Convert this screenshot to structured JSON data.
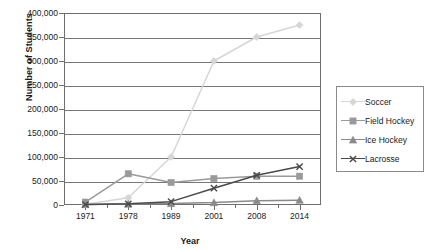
{
  "chart_data": {
    "type": "line",
    "title": "",
    "xlabel": "Year",
    "ylabel": "Number of Students",
    "x": [
      1971,
      1978,
      1989,
      2001,
      2008,
      2014
    ],
    "categories": [
      "1971",
      "1978",
      "1989",
      "2001",
      "2008",
      "2014"
    ],
    "xtick_labels": [
      "1971",
      "1978",
      "1989",
      "2001",
      "2008",
      "2014"
    ],
    "ytick_labels": [
      "0",
      "50,000",
      "100,000",
      "150,000",
      "200,000",
      "250,000",
      "300,000",
      "350,000",
      "400,000"
    ],
    "ytick_values": [
      0,
      50000,
      100000,
      150000,
      200000,
      250000,
      300000,
      350000,
      400000
    ],
    "ylim": [
      0,
      400000
    ],
    "grid": true,
    "legend_position": "right",
    "series": [
      {
        "name": "Soccer",
        "marker": "diamond",
        "color": "#d6d6d6",
        "values": [
          1500,
          15000,
          100000,
          300000,
          350000,
          375000
        ]
      },
      {
        "name": "Field Hockey",
        "marker": "square",
        "color": "#9a9a9a",
        "values": [
          6000,
          65000,
          47000,
          55000,
          60000,
          60000
        ]
      },
      {
        "name": "Ice Hockey",
        "marker": "triangle",
        "color": "#8a8a8a",
        "values": [
          1000,
          2000,
          3000,
          5000,
          9000,
          10000
        ]
      },
      {
        "name": "Lacrosse",
        "marker": "cross",
        "color": "#4a4a4a",
        "values": [
          1000,
          2500,
          7000,
          35000,
          62000,
          80000
        ]
      }
    ]
  },
  "legend": {
    "items": [
      {
        "label": "Soccer"
      },
      {
        "label": "Field Hockey"
      },
      {
        "label": "Ice Hockey"
      },
      {
        "label": "Lacrosse"
      }
    ]
  }
}
